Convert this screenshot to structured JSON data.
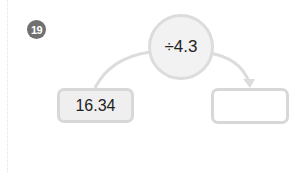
{
  "problem": {
    "number": "19"
  },
  "operation": {
    "label": "÷4.3"
  },
  "input_box": {
    "value": "16.34"
  },
  "output_box": {
    "value": ""
  },
  "colors": {
    "badge": "#707070",
    "circle_fill": "#f2f2f2",
    "border": "#d8d8d8",
    "input_fill": "#efefef",
    "output_fill": "#ffffff"
  }
}
